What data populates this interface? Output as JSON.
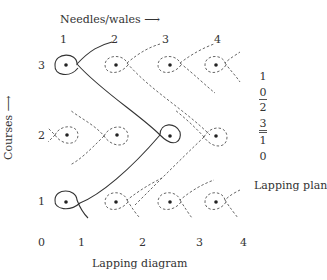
{
  "header": {
    "needles_label": "Needles/wales",
    "arrow": "⟶"
  },
  "wales": [
    "1",
    "2",
    "3",
    "4"
  ],
  "courses_label": "Courses",
  "courses": [
    "3",
    "2",
    "1"
  ],
  "bottom_axis": [
    "0",
    "1",
    "2",
    "3",
    "4"
  ],
  "captions": {
    "diagram": "Lapping diagram",
    "plan": "Lapping plan"
  },
  "lapping_plan": [
    "1",
    "0",
    "2",
    "3",
    "1",
    "0"
  ],
  "colors": {
    "ink": "#333333",
    "dashed": "#555555"
  }
}
